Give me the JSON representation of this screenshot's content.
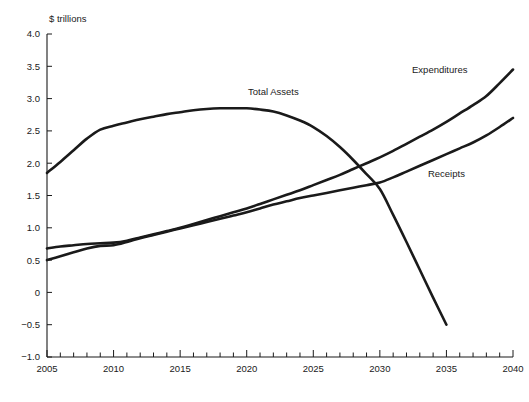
{
  "chart_data": {
    "type": "line",
    "title": "",
    "ylabel": "$ trillions",
    "xlabel": "",
    "xlim": [
      2005,
      2040
    ],
    "ylim": [
      -1.0,
      4.0
    ],
    "grid": false,
    "legend_position": "inline-annotations",
    "y_ticks": [
      -1.0,
      -0.5,
      0,
      0.5,
      1.0,
      1.5,
      2.0,
      2.5,
      3.0,
      3.5,
      4.0
    ],
    "y_tick_labels": [
      "-1.0",
      "-0.5",
      "0",
      "0.5",
      "1.0",
      "1.5",
      "2.0",
      "2.5",
      "3.0",
      "3.5",
      "4.0"
    ],
    "x_ticks": [
      2005,
      2010,
      2015,
      2020,
      2025,
      2030,
      2035,
      2040
    ],
    "x_tick_labels": [
      "2005",
      "2010",
      "2015",
      "2020",
      "2025",
      "2030",
      "2035",
      "2040"
    ],
    "x_minor_tick_interval": 1,
    "series": [
      {
        "name": "Total Assets",
        "label": "Total Assets",
        "color": "#1a1a1a",
        "x": [
          2005,
          2006,
          2007,
          2008,
          2009,
          2010,
          2011,
          2012,
          2013,
          2014,
          2015,
          2016,
          2017,
          2018,
          2019,
          2020,
          2021,
          2022,
          2023,
          2024,
          2025,
          2026,
          2027,
          2028,
          2029,
          2030,
          2031,
          2032,
          2033,
          2034,
          2035
        ],
        "values": [
          1.85,
          2.02,
          2.2,
          2.38,
          2.52,
          2.58,
          2.63,
          2.68,
          2.72,
          2.76,
          2.79,
          2.82,
          2.84,
          2.85,
          2.85,
          2.85,
          2.83,
          2.8,
          2.74,
          2.66,
          2.56,
          2.42,
          2.25,
          2.05,
          1.83,
          1.6,
          1.2,
          0.78,
          0.35,
          -0.08,
          -0.5
        ]
      },
      {
        "name": "Expenditures",
        "label": "Expenditures",
        "color": "#1a1a1a",
        "x": [
          2005,
          2006,
          2007,
          2008,
          2009,
          2010,
          2011,
          2012,
          2013,
          2014,
          2015,
          2016,
          2017,
          2018,
          2019,
          2020,
          2021,
          2022,
          2023,
          2024,
          2025,
          2026,
          2027,
          2028,
          2029,
          2030,
          2031,
          2032,
          2033,
          2034,
          2035,
          2036,
          2037,
          2038,
          2039,
          2040
        ],
        "values": [
          0.68,
          0.71,
          0.73,
          0.75,
          0.76,
          0.77,
          0.8,
          0.85,
          0.9,
          0.95,
          1.0,
          1.06,
          1.12,
          1.18,
          1.24,
          1.3,
          1.37,
          1.44,
          1.51,
          1.58,
          1.66,
          1.74,
          1.82,
          1.91,
          2.0,
          2.09,
          2.19,
          2.3,
          2.41,
          2.52,
          2.64,
          2.77,
          2.9,
          3.04,
          3.24,
          3.45
        ]
      },
      {
        "name": "Receipts",
        "label": "Receipts",
        "color": "#1a1a1a",
        "x": [
          2005,
          2006,
          2007,
          2008,
          2009,
          2010,
          2011,
          2012,
          2013,
          2014,
          2015,
          2016,
          2017,
          2018,
          2019,
          2020,
          2021,
          2022,
          2023,
          2024,
          2025,
          2026,
          2027,
          2028,
          2029,
          2030,
          2031,
          2032,
          2033,
          2034,
          2035,
          2036,
          2037,
          2038,
          2039,
          2040
        ],
        "values": [
          0.5,
          0.56,
          0.62,
          0.68,
          0.72,
          0.73,
          0.78,
          0.84,
          0.89,
          0.94,
          0.99,
          1.04,
          1.09,
          1.14,
          1.19,
          1.24,
          1.3,
          1.36,
          1.41,
          1.46,
          1.5,
          1.54,
          1.58,
          1.62,
          1.66,
          1.7,
          1.78,
          1.87,
          1.96,
          2.05,
          2.14,
          2.23,
          2.32,
          2.43,
          2.56,
          2.7
        ]
      }
    ],
    "annotations": [
      {
        "text": "Total Assets",
        "x": 2022.0,
        "y": 3.05
      },
      {
        "text": "Expenditures",
        "x": 2034.5,
        "y": 3.4
      },
      {
        "text": "Receipts",
        "x": 2035.0,
        "y": 1.78
      }
    ]
  }
}
